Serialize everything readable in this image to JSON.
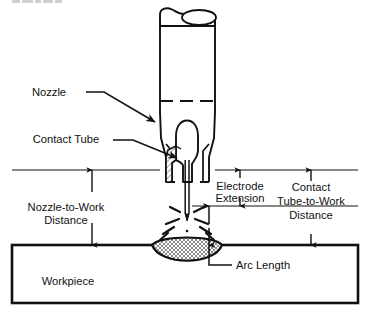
{
  "figure": {
    "top_partial_text": "",
    "colors": {
      "ink": "#111111",
      "background": "#ffffff",
      "hatch": "#333333"
    }
  },
  "labels": {
    "nozzle": "Nozzle",
    "contact_tube": "Contact Tube",
    "nozzle_to_work_distance": "Nozzle-to-Work\nDistance",
    "nozzle_to_work_distance_line1": "Nozzle-to-Work",
    "nozzle_to_work_distance_line2": "Distance",
    "electrode_extension_line1": "Electrode",
    "electrode_extension_line2": "Extension",
    "contact_tube_to_work_line1": "Contact",
    "contact_tube_to_work_line2": "Tube-to-Work",
    "contact_tube_to_work_line3": "Distance",
    "arc_length": "Arc Length",
    "workpiece": "Workpiece"
  },
  "parts": [
    {
      "id": "nozzle",
      "name": "Nozzle",
      "callout": true
    },
    {
      "id": "contact-tube",
      "name": "Contact Tube",
      "callout": true
    },
    {
      "id": "electrode",
      "name": "Electrode wire",
      "callout": false
    },
    {
      "id": "arc",
      "name": "Welding arc",
      "callout": false
    },
    {
      "id": "weld-pool",
      "name": "Weld pool",
      "callout": false
    },
    {
      "id": "workpiece",
      "name": "Workpiece",
      "callout": true
    }
  ],
  "dimensions": [
    {
      "id": "nozzle-to-work-distance",
      "label": "Nozzle-to-Work Distance",
      "side": "left",
      "style": "double-arrow"
    },
    {
      "id": "electrode-extension",
      "label": "Electrode Extension",
      "side": "center-right",
      "style": "double-arrow"
    },
    {
      "id": "contact-tube-to-work-distance",
      "label": "Contact Tube-to-Work Distance",
      "side": "right",
      "style": "double-arrow"
    },
    {
      "id": "arc-length",
      "label": "Arc Length",
      "side": "center",
      "style": "double-arrow-leader"
    }
  ]
}
